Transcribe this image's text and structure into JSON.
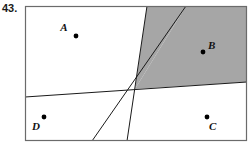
{
  "problem": {
    "number": "43."
  },
  "figure": {
    "frame": {
      "x": 25,
      "y": 6,
      "width": 222,
      "height": 135
    },
    "colors": {
      "shaded_region": "#a6a6a6",
      "line": "#1a1a1a",
      "border": "#555555",
      "background": "#ffffff",
      "point": "#000000",
      "label": "#111111"
    },
    "shaded_region_description": "wedge bounded by two lines in the upper-right quadrant",
    "lines": [
      {
        "name": "steep-left-line",
        "x1": 147,
        "y1": 6,
        "x2": 127,
        "y2": 141
      },
      {
        "name": "steep-right-line",
        "x1": 186,
        "y1": 6,
        "x2": 92,
        "y2": 141
      },
      {
        "name": "near-horizontal-line",
        "x1": 25,
        "y1": 97,
        "x2": 247,
        "y2": 82
      }
    ],
    "intersection": {
      "x": 135,
      "y": 89
    },
    "points": [
      {
        "label": "A",
        "dot_x": 76,
        "dot_y": 36,
        "label_x": 64,
        "label_y": 31
      },
      {
        "label": "B",
        "dot_x": 203,
        "dot_y": 52,
        "label_x": 208,
        "label_y": 49
      },
      {
        "label": "C",
        "dot_x": 207,
        "dot_y": 117,
        "label_x": 209,
        "label_y": 130
      },
      {
        "label": "D",
        "dot_x": 44,
        "dot_y": 117,
        "label_x": 32,
        "label_y": 130
      }
    ]
  }
}
